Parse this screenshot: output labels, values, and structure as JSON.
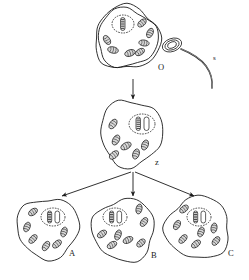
{
  "diagram": {
    "background_color": "#ffffff",
    "stroke_color": "#1a1a1a",
    "mito_fill": "#d8d8d8",
    "nucleus_fill": "#ffffff"
  },
  "labels": {
    "ovum": "O",
    "sperm": "s",
    "zygote": "z",
    "cell_a": "A",
    "cell_b": "B",
    "cell_c": "C"
  },
  "cells": [
    {
      "id": "ovum",
      "label": "O",
      "label_x": 158,
      "label_y": 70,
      "cx": 127,
      "cy": 38,
      "rx": 30,
      "ry": 29,
      "double_membrane": true,
      "nucleus": {
        "cx": 123,
        "cy": 24,
        "rx": 11,
        "ry": 9
      },
      "chromosomes": [
        {
          "x": 120.5,
          "y": 17.5,
          "w": 4.5,
          "h": 13,
          "striped": true
        }
      ],
      "mitochondria": [
        {
          "cx": 142,
          "cy": 23,
          "rx": 5.0,
          "ry": 3.0,
          "rot": -42
        },
        {
          "cx": 150,
          "cy": 33,
          "rx": 5.0,
          "ry": 3.0,
          "rot": -65
        },
        {
          "cx": 144,
          "cy": 43,
          "rx": 5.2,
          "ry": 3.0,
          "rot": 8
        },
        {
          "cx": 113,
          "cy": 50,
          "rx": 5.4,
          "ry": 3.2,
          "rot": 12
        },
        {
          "cx": 130,
          "cy": 53,
          "rx": 5.4,
          "ry": 3.2,
          "rot": -18
        },
        {
          "cx": 140,
          "cy": 52,
          "rx": 5.0,
          "ry": 3.0,
          "rot": -32
        },
        {
          "cx": 107,
          "cy": 40,
          "rx": 5.0,
          "ry": 3.0,
          "rot": 58
        }
      ]
    },
    {
      "id": "zygote",
      "label": "z",
      "label_x": 155,
      "label_y": 165,
      "cx": 131,
      "cy": 133,
      "rx": 31,
      "ry": 33,
      "double_membrane": false,
      "nucleus": {
        "cx": 142,
        "cy": 124,
        "rx": 13,
        "ry": 10
      },
      "chromosomes": [
        {
          "x": 136,
          "y": 117,
          "w": 4.5,
          "h": 13.5,
          "striped": true
        },
        {
          "x": 144,
          "y": 117,
          "w": 5.0,
          "h": 13.5,
          "striped": false
        }
      ],
      "mitochondria": [
        {
          "cx": 113,
          "cy": 124,
          "rx": 5.4,
          "ry": 3.2,
          "rot": -55
        },
        {
          "cx": 116,
          "cy": 140,
          "rx": 5.4,
          "ry": 3.2,
          "rot": -62
        },
        {
          "cx": 126,
          "cy": 146,
          "rx": 5.6,
          "ry": 3.2,
          "rot": -28
        },
        {
          "cx": 114,
          "cy": 155,
          "rx": 5.4,
          "ry": 3.2,
          "rot": -40
        },
        {
          "cx": 136,
          "cy": 154,
          "rx": 5.2,
          "ry": 3.2,
          "rot": -72
        },
        {
          "cx": 145,
          "cy": 145,
          "rx": 5.2,
          "ry": 3.2,
          "rot": -68
        }
      ]
    },
    {
      "id": "cell_a",
      "label": "A",
      "label_x": 69,
      "label_y": 256,
      "cx": 48,
      "cy": 228,
      "rx": 31,
      "ry": 30,
      "double_membrane": false,
      "nucleus": {
        "cx": 53,
        "cy": 217,
        "rx": 12,
        "ry": 9
      },
      "chromosomes": [
        {
          "x": 47.5,
          "y": 211,
          "w": 4.2,
          "h": 12,
          "striped": true
        },
        {
          "x": 55,
          "y": 211,
          "w": 4.6,
          "h": 12,
          "striped": false
        }
      ],
      "mitochondria": [
        {
          "cx": 33,
          "cy": 212,
          "rx": 5.0,
          "ry": 3.0,
          "rot": -35
        },
        {
          "cx": 27,
          "cy": 227,
          "rx": 5.0,
          "ry": 3.0,
          "rot": -68
        },
        {
          "cx": 33,
          "cy": 239,
          "rx": 5.2,
          "ry": 3.0,
          "rot": -48
        },
        {
          "cx": 46,
          "cy": 246,
          "rx": 5.2,
          "ry": 3.0,
          "rot": -58
        },
        {
          "cx": 57,
          "cy": 244,
          "rx": 5.2,
          "ry": 3.0,
          "rot": -40
        },
        {
          "cx": 64,
          "cy": 232,
          "rx": 5.0,
          "ry": 3.0,
          "rot": -72
        }
      ]
    },
    {
      "id": "cell_b",
      "label": "B",
      "label_x": 151,
      "label_y": 258,
      "cx": 124,
      "cy": 230,
      "rx": 31,
      "ry": 31,
      "double_membrane": false,
      "nucleus": {
        "cx": 115,
        "cy": 217,
        "rx": 12,
        "ry": 9
      },
      "chromosomes": [
        {
          "x": 109.5,
          "y": 211,
          "w": 4.2,
          "h": 12,
          "striped": true
        },
        {
          "x": 117,
          "y": 211,
          "w": 4.6,
          "h": 12,
          "striped": false
        }
      ],
      "mitochondria": [
        {
          "cx": 139,
          "cy": 209,
          "rx": 5.0,
          "ry": 3.0,
          "rot": -78
        },
        {
          "cx": 144,
          "cy": 222,
          "rx": 5.0,
          "ry": 3.0,
          "rot": -55
        },
        {
          "cx": 102,
          "cy": 234,
          "rx": 5.2,
          "ry": 3.0,
          "rot": -35
        },
        {
          "cx": 118,
          "cy": 235,
          "rx": 5.2,
          "ry": 3.0,
          "rot": -70
        },
        {
          "cx": 128,
          "cy": 240,
          "rx": 5.2,
          "ry": 3.0,
          "rot": -25
        },
        {
          "cx": 112,
          "cy": 245,
          "rx": 5.2,
          "ry": 3.0,
          "rot": -30
        },
        {
          "cx": 141,
          "cy": 243,
          "rx": 5.0,
          "ry": 3.0,
          "rot": -42
        }
      ]
    },
    {
      "id": "cell_c",
      "label": "C",
      "label_x": 228,
      "label_y": 256,
      "cx": 198,
      "cy": 228,
      "rx": 32,
      "ry": 31,
      "double_membrane": false,
      "nucleus": {
        "cx": 199,
        "cy": 217,
        "rx": 12,
        "ry": 9
      },
      "chromosomes": [
        {
          "x": 193.5,
          "y": 211,
          "w": 4.2,
          "h": 12,
          "striped": true
        },
        {
          "x": 201,
          "y": 211,
          "w": 4.6,
          "h": 12,
          "striped": false
        }
      ],
      "mitochondria": [
        {
          "cx": 184,
          "cy": 209,
          "rx": 5.0,
          "ry": 3.0,
          "rot": -40
        },
        {
          "cx": 177,
          "cy": 225,
          "rx": 5.0,
          "ry": 3.0,
          "rot": -62
        },
        {
          "cx": 183,
          "cy": 239,
          "rx": 5.2,
          "ry": 3.0,
          "rot": -48
        },
        {
          "cx": 196,
          "cy": 244,
          "rx": 5.2,
          "ry": 3.0,
          "rot": -38
        },
        {
          "cx": 201,
          "cy": 232,
          "rx": 5.0,
          "ry": 3.0,
          "rot": -70
        },
        {
          "cx": 214,
          "cy": 228,
          "rx": 5.0,
          "ry": 3.0,
          "rot": -80
        },
        {
          "cx": 216,
          "cy": 241,
          "rx": 5.0,
          "ry": 3.0,
          "rot": -52
        }
      ]
    }
  ],
  "sperm": {
    "label": "s",
    "label_x": 213,
    "label_y": 60,
    "head": {
      "cx": 172,
      "cy": 45,
      "rx": 10,
      "ry": 6.5,
      "rot": -20
    },
    "tail_path": "M181,49 C191,53 200,58 206,66 C211,73 213,80 212,88"
  },
  "arrows": [
    {
      "id": "arrow-ovum-to-zygote",
      "x1": 133,
      "y1": 79,
      "x2": 133,
      "y2": 99
    },
    {
      "id": "arrow-zygote-to-a",
      "x1": 131,
      "y1": 172,
      "x2": 62,
      "y2": 196
    },
    {
      "id": "arrow-zygote-to-b",
      "x1": 133,
      "y1": 172,
      "x2": 133,
      "y2": 196
    },
    {
      "id": "arrow-zygote-to-c",
      "x1": 135,
      "y1": 172,
      "x2": 194,
      "y2": 196
    }
  ]
}
